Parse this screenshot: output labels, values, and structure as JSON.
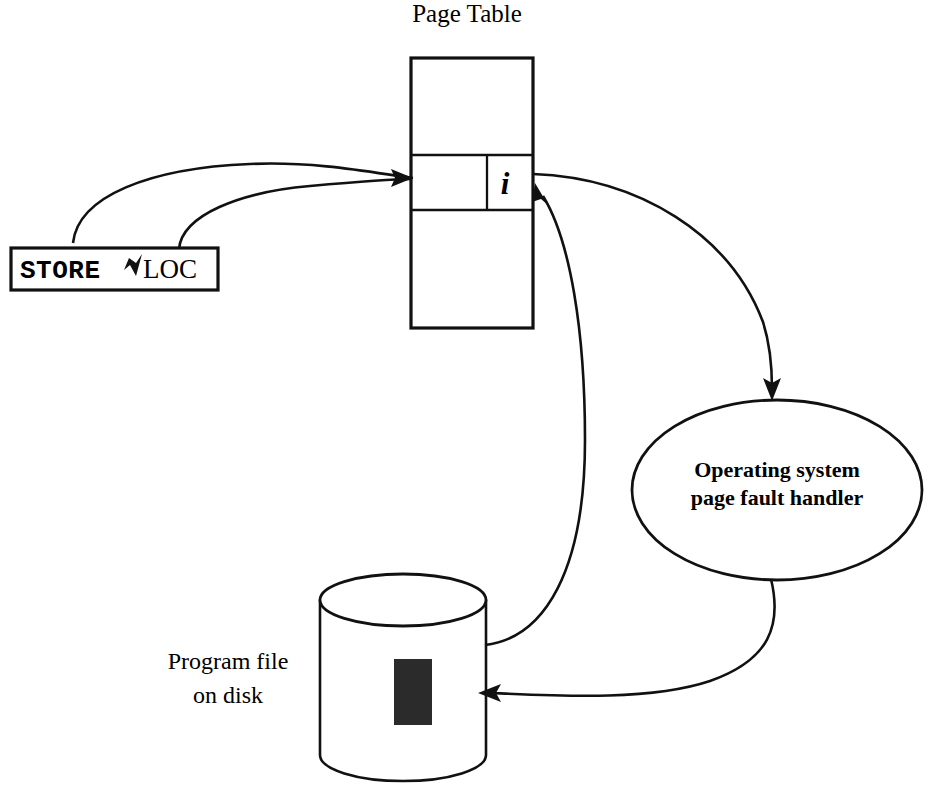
{
  "diagram": {
    "title": "Page Table",
    "instruction_box": {
      "opcode": "STORE",
      "operand": "LOC",
      "pointer_icon": "down-left-arrowhead-icon"
    },
    "page_table": {
      "label": "Page Table",
      "entry_flag": "i",
      "rows": 3,
      "highlighted_row_index": 1
    },
    "os_handler": {
      "line1": "Operating system",
      "line2": "page fault handler"
    },
    "disk": {
      "line1": "Program file",
      "line2": "on disk",
      "block_fill": "#2b2b2b"
    },
    "connectors": [
      {
        "name": "store-to-page-table-outer",
        "from": "STORE",
        "to": "Page Table entry"
      },
      {
        "name": "loc-to-page-table-inner",
        "from": "LOC",
        "to": "Page Table entry"
      },
      {
        "name": "page-table-to-os-handler",
        "from": "Page Table entry",
        "to": "Operating system page fault handler"
      },
      {
        "name": "os-handler-to-disk",
        "from": "Operating system page fault handler",
        "to": "Program file on disk"
      },
      {
        "name": "disk-to-page-table",
        "from": "Program file on disk",
        "to": "Page Table entry"
      }
    ],
    "colors": {
      "ink": "#111111",
      "background": "#ffffff",
      "block": "#2b2b2b"
    }
  }
}
